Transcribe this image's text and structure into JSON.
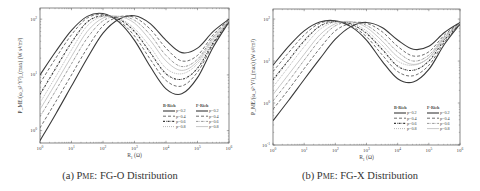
{
  "chart_data": [
    {
      "type": "line",
      "title": "(a) PME: FG-O Distribution",
      "caption": {
        "prefix": "(a) P",
        "subscript": "ME",
        "suffix": ": FG-O Distribution"
      },
      "xlabel": "R_1 (Ω)",
      "ylabel": "P_ME/(ω_s²·Y²)_(max) (W s⁴/m²)",
      "xscale": "log",
      "yscale": "log",
      "xlim": [
        1,
        1000000
      ],
      "ylim": [
        0.6,
        160
      ],
      "xticks": [
        "10^0",
        "10^1",
        "10^2",
        "10^3",
        "10^4",
        "10^5",
        "10^6"
      ],
      "yticks": [
        "10^0",
        "10^1",
        "10^2"
      ],
      "grid": false,
      "legend": {
        "position": "lower right",
        "groups": [
          {
            "title": "B-Rich",
            "entries": [
              "p=0.2",
              "p=0.4",
              "p=0.6",
              "p=0.8"
            ]
          },
          {
            "title": "F-Rich",
            "entries": [
              "p=0.2",
              "p=0.4",
              "p=0.6",
              "p=0.8"
            ]
          }
        ]
      },
      "x_log10": [
        0,
        0.5,
        1,
        1.5,
        2,
        2.5,
        3,
        3.5,
        4,
        4.5,
        5,
        5.5,
        6
      ],
      "series": [
        {
          "name": "B-Rich p=0.2",
          "style": "solid",
          "log10_y": [
            1.0,
            1.42,
            1.8,
            2.05,
            2.1,
            1.95,
            1.62,
            1.15,
            0.75,
            0.66,
            0.95,
            1.5,
            1.95
          ]
        },
        {
          "name": "B-Rich p=0.4",
          "style": "dashed",
          "log10_y": [
            0.85,
            1.3,
            1.72,
            2.02,
            2.08,
            1.97,
            1.7,
            1.28,
            0.9,
            0.8,
            1.05,
            1.55,
            1.95
          ]
        },
        {
          "name": "B-Rich p=0.6",
          "style": "dashdot-thick",
          "log10_y": [
            0.65,
            1.12,
            1.58,
            1.95,
            2.06,
            2.0,
            1.78,
            1.4,
            1.02,
            0.92,
            1.12,
            1.58,
            1.96
          ]
        },
        {
          "name": "B-Rich p=0.8",
          "style": "dotted",
          "log10_y": [
            0.5,
            0.97,
            1.45,
            1.88,
            2.05,
            2.02,
            1.83,
            1.5,
            1.12,
            1.02,
            1.2,
            1.62,
            1.96
          ]
        },
        {
          "name": "F-Rich p=0.2",
          "style": "solid",
          "log10_y": [
            -0.18,
            0.3,
            0.8,
            1.3,
            1.75,
            2.0,
            2.06,
            1.92,
            1.62,
            1.4,
            1.48,
            1.78,
            2.0
          ]
        },
        {
          "name": "F-Rich p=0.4",
          "style": "dashed",
          "log10_y": [
            0.05,
            0.52,
            1.0,
            1.48,
            1.88,
            2.04,
            2.03,
            1.82,
            1.48,
            1.25,
            1.35,
            1.72,
            1.99
          ]
        },
        {
          "name": "F-Rich p=0.6",
          "style": "dashdot",
          "log10_y": [
            0.25,
            0.72,
            1.2,
            1.66,
            1.97,
            2.05,
            1.98,
            1.72,
            1.35,
            1.15,
            1.28,
            1.68,
            1.98
          ]
        },
        {
          "name": "F-Rich p=0.8",
          "style": "dotted-light",
          "log10_y": [
            0.38,
            0.85,
            1.33,
            1.78,
            2.02,
            2.05,
            1.93,
            1.62,
            1.25,
            1.08,
            1.24,
            1.65,
            1.97
          ]
        }
      ]
    },
    {
      "type": "line",
      "title": "(b) PME: FG-X Distribution",
      "caption": {
        "prefix": "(b) P",
        "subscript": "ME",
        "suffix": ": FG-X Distribution"
      },
      "xlabel": "R_1 (Ω)",
      "ylabel": "P_ME/(ω_s²·Y²)_(max) (W s⁴/m²)",
      "xscale": "log",
      "yscale": "log",
      "xlim": [
        1,
        1000000
      ],
      "ylim": [
        0.1,
        160
      ],
      "xticks": [
        "10^0",
        "10^1",
        "10^2",
        "10^3",
        "10^4",
        "10^5",
        "10^6"
      ],
      "yticks": [
        "10^-1",
        "10^0",
        "10^1",
        "10^2"
      ],
      "grid": false,
      "legend": {
        "position": "lower right",
        "groups": [
          {
            "title": "B-Rich",
            "entries": [
              "p=0.2",
              "p=0.4",
              "p=0.6",
              "p=0.8"
            ]
          },
          {
            "title": "F-Rich",
            "entries": [
              "p=0.2",
              "p=0.4",
              "p=0.6",
              "p=0.8"
            ]
          }
        ]
      },
      "x_log10": [
        0,
        0.5,
        1,
        1.5,
        2,
        2.5,
        3,
        3.5,
        4,
        4.5,
        5,
        5.5,
        6
      ],
      "series": [
        {
          "name": "B-Rich p=0.2",
          "style": "solid",
          "log10_y": [
            0.9,
            1.35,
            1.72,
            1.93,
            1.96,
            1.82,
            1.5,
            1.0,
            0.58,
            0.5,
            0.8,
            1.4,
            1.88
          ]
        },
        {
          "name": "B-Rich p=0.4",
          "style": "dashed",
          "log10_y": [
            0.75,
            1.2,
            1.62,
            1.9,
            1.95,
            1.84,
            1.58,
            1.15,
            0.75,
            0.65,
            0.9,
            1.45,
            1.88
          ]
        },
        {
          "name": "B-Rich p=0.6",
          "style": "dashdot-thick",
          "log10_y": [
            0.55,
            1.02,
            1.48,
            1.83,
            1.94,
            1.88,
            1.66,
            1.28,
            0.88,
            0.78,
            1.0,
            1.5,
            1.89
          ]
        },
        {
          "name": "B-Rich p=0.8",
          "style": "dotted",
          "log10_y": [
            0.38,
            0.86,
            1.34,
            1.75,
            1.93,
            1.9,
            1.72,
            1.38,
            1.0,
            0.9,
            1.08,
            1.55,
            1.89
          ]
        },
        {
          "name": "F-Rich p=0.2",
          "style": "solid",
          "log10_y": [
            -0.42,
            0.06,
            0.56,
            1.05,
            1.52,
            1.82,
            1.92,
            1.8,
            1.5,
            1.28,
            1.35,
            1.68,
            1.92
          ]
        },
        {
          "name": "F-Rich p=0.4",
          "style": "dashed",
          "log10_y": [
            -0.15,
            0.32,
            0.82,
            1.3,
            1.72,
            1.9,
            1.9,
            1.7,
            1.35,
            1.12,
            1.22,
            1.62,
            1.91
          ]
        },
        {
          "name": "F-Rich p=0.6",
          "style": "dashdot",
          "log10_y": [
            0.05,
            0.52,
            1.02,
            1.5,
            1.84,
            1.93,
            1.85,
            1.58,
            1.22,
            1.0,
            1.14,
            1.58,
            1.9
          ]
        },
        {
          "name": "F-Rich p=0.8",
          "style": "dotted-light",
          "log10_y": [
            0.2,
            0.68,
            1.16,
            1.62,
            1.89,
            1.94,
            1.8,
            1.48,
            1.1,
            0.92,
            1.08,
            1.55,
            1.9
          ]
        }
      ]
    }
  ]
}
